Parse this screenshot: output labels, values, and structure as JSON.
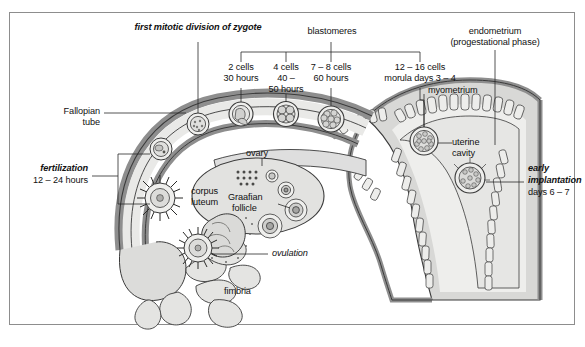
{
  "figure": {
    "labels": {
      "first_mitotic": "first mitotic division of zygote",
      "blastomeres": "blastomeres",
      "endometrium_l1": "endometrium",
      "endometrium_l2": "(progestational phase)",
      "two_cells_l1": "2 cells",
      "two_cells_l2": "30 hours",
      "four_cells_l1": "4 cells",
      "four_cells_l2": "40 –",
      "four_cells_l3": "50 hours",
      "seven_eight_l1": "7 – 8 cells",
      "seven_eight_l2": "60 hours",
      "morula_l1": "12 – 16 cells",
      "morula_l2": "morula days 3 – 4",
      "myometrium": "myometrium",
      "uterine_cavity_l1": "uterine",
      "uterine_cavity_l2": "cavity",
      "fallopian_l1": "Fallopian",
      "fallopian_l2": "tube",
      "fertilization_l1": "fertilization",
      "fertilization_l2": "12 – 24 hours",
      "ovary": "ovary",
      "corpus_luteum_l1": "corpus",
      "corpus_luteum_l2": "luteum",
      "graafian_l1": "Graafian",
      "graafian_l2": "follicle",
      "ovulation": "ovulation",
      "fimbria": "fimbria",
      "early_impl_l1": "early",
      "early_impl_l2": "implantation",
      "early_impl_l3": "days 6 – 7"
    },
    "colors": {
      "wall_fill": "#b9b9b9",
      "lumen_fill": "#e6e6e4",
      "tissue_fill": "#d8d8d6",
      "outline": "#3a3a3a",
      "leader_line": "#2a2a2a",
      "frame_border": "#8d8d8d",
      "text": "#111111",
      "page_background": "#ffffff"
    },
    "stages": [
      {
        "name": "zygote",
        "cells": 1
      },
      {
        "name": "2-cell",
        "cells": 2
      },
      {
        "name": "4-cell",
        "cells": 4
      },
      {
        "name": "7-8-cell",
        "cells": 8
      },
      {
        "name": "morula",
        "cells": 16
      },
      {
        "name": "blastocyst",
        "cells": 32
      }
    ]
  }
}
